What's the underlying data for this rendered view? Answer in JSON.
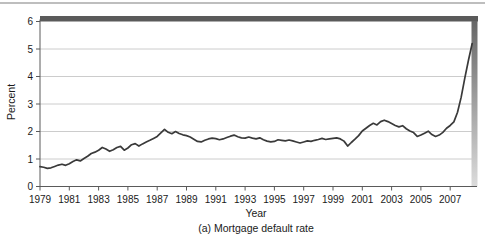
{
  "figure": {
    "caption": "(a) Mortgage default rate"
  },
  "chart_data": {
    "type": "line",
    "title": "",
    "xlabel": "Year",
    "ylabel": "Percent",
    "ylim": [
      0,
      6
    ],
    "y_ticks": [
      0,
      1,
      2,
      3,
      4,
      5,
      6
    ],
    "x_ticks": [
      1979,
      1981,
      1983,
      1985,
      1987,
      1989,
      1991,
      1993,
      1995,
      1997,
      1999,
      2001,
      2003,
      2005,
      2007
    ],
    "grid": true,
    "legend": "none",
    "x_start_year": 1979,
    "points_per_year": 4,
    "series": [
      {
        "name": "Mortgage default rate",
        "values": [
          0.72,
          0.7,
          0.66,
          0.68,
          0.73,
          0.78,
          0.81,
          0.77,
          0.83,
          0.91,
          0.97,
          0.93,
          1.02,
          1.1,
          1.2,
          1.25,
          1.32,
          1.42,
          1.36,
          1.28,
          1.34,
          1.42,
          1.46,
          1.32,
          1.4,
          1.52,
          1.56,
          1.47,
          1.55,
          1.62,
          1.68,
          1.75,
          1.82,
          1.95,
          2.08,
          1.97,
          1.92,
          2.0,
          1.93,
          1.88,
          1.85,
          1.8,
          1.72,
          1.64,
          1.62,
          1.68,
          1.73,
          1.76,
          1.74,
          1.7,
          1.73,
          1.78,
          1.83,
          1.87,
          1.81,
          1.77,
          1.76,
          1.8,
          1.76,
          1.73,
          1.77,
          1.7,
          1.65,
          1.62,
          1.64,
          1.7,
          1.68,
          1.66,
          1.69,
          1.66,
          1.62,
          1.58,
          1.62,
          1.66,
          1.64,
          1.68,
          1.71,
          1.75,
          1.71,
          1.73,
          1.75,
          1.77,
          1.73,
          1.65,
          1.47,
          1.6,
          1.72,
          1.85,
          2.02,
          2.12,
          2.22,
          2.3,
          2.24,
          2.36,
          2.41,
          2.36,
          2.29,
          2.22,
          2.17,
          2.21,
          2.1,
          2.02,
          1.96,
          1.82,
          1.87,
          1.94,
          2.01,
          1.89,
          1.82,
          1.87,
          1.97,
          2.12,
          2.22,
          2.35,
          2.7,
          3.25,
          3.95,
          4.6,
          5.2
        ]
      }
    ],
    "colors": {
      "line": "#3a3a3a",
      "gridline": "#c6c6c6",
      "axis": "#5a5a5a",
      "tick_label": "#1a1a1a",
      "top_frame_bar": "#5a5a5a",
      "right_frame_bar_top": "#666666",
      "right_frame_bar_bottom": "#dcdcdc",
      "top_rule": "#a8a8a8"
    }
  }
}
